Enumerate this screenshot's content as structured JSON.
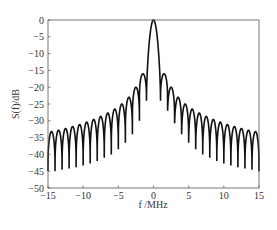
{
  "chart_data": {
    "type": "line",
    "title": "",
    "xlabel": "f /MHz",
    "ylabel": "S(f)/dB",
    "xlim": [
      -15,
      15
    ],
    "ylim": [
      -50,
      0
    ],
    "xticks": [
      -15,
      -10,
      -5,
      0,
      5,
      10,
      15
    ],
    "yticks": [
      0,
      -5,
      -10,
      -15,
      -20,
      -25,
      -30,
      -35,
      -40,
      -45,
      -50
    ],
    "grid": false,
    "legend": null,
    "series": [
      {
        "name": "S(f)",
        "color": "#111111",
        "description": "sinc^2-like spectrum: main lobe peak 0 dB at f=0, nulls at integer MHz, sidelobe peaks at half-integer MHz",
        "main_lobe": {
          "f": 0,
          "value": 0,
          "null_f": 1
        },
        "sidelobe_peaks_f": [
          1.5,
          2.5,
          3.5,
          4.5,
          5.5,
          6.5,
          7.5,
          8.5,
          9.5,
          10.5,
          11.5,
          12.5,
          13.5,
          14.5
        ],
        "sidelobe_peaks_db": [
          -16,
          -20,
          -23,
          -25,
          -26.5,
          -27.7,
          -28.7,
          -29.6,
          -30.4,
          -31.1,
          -31.7,
          -32.3,
          -32.8,
          -33.2
        ],
        "null_floor_db": [
          -24,
          -30,
          -34,
          -36.5,
          -38.5,
          -40,
          -41,
          -42,
          -42.7,
          -43.3,
          -43.8,
          -44.2,
          -44.6,
          -45
        ]
      }
    ]
  }
}
